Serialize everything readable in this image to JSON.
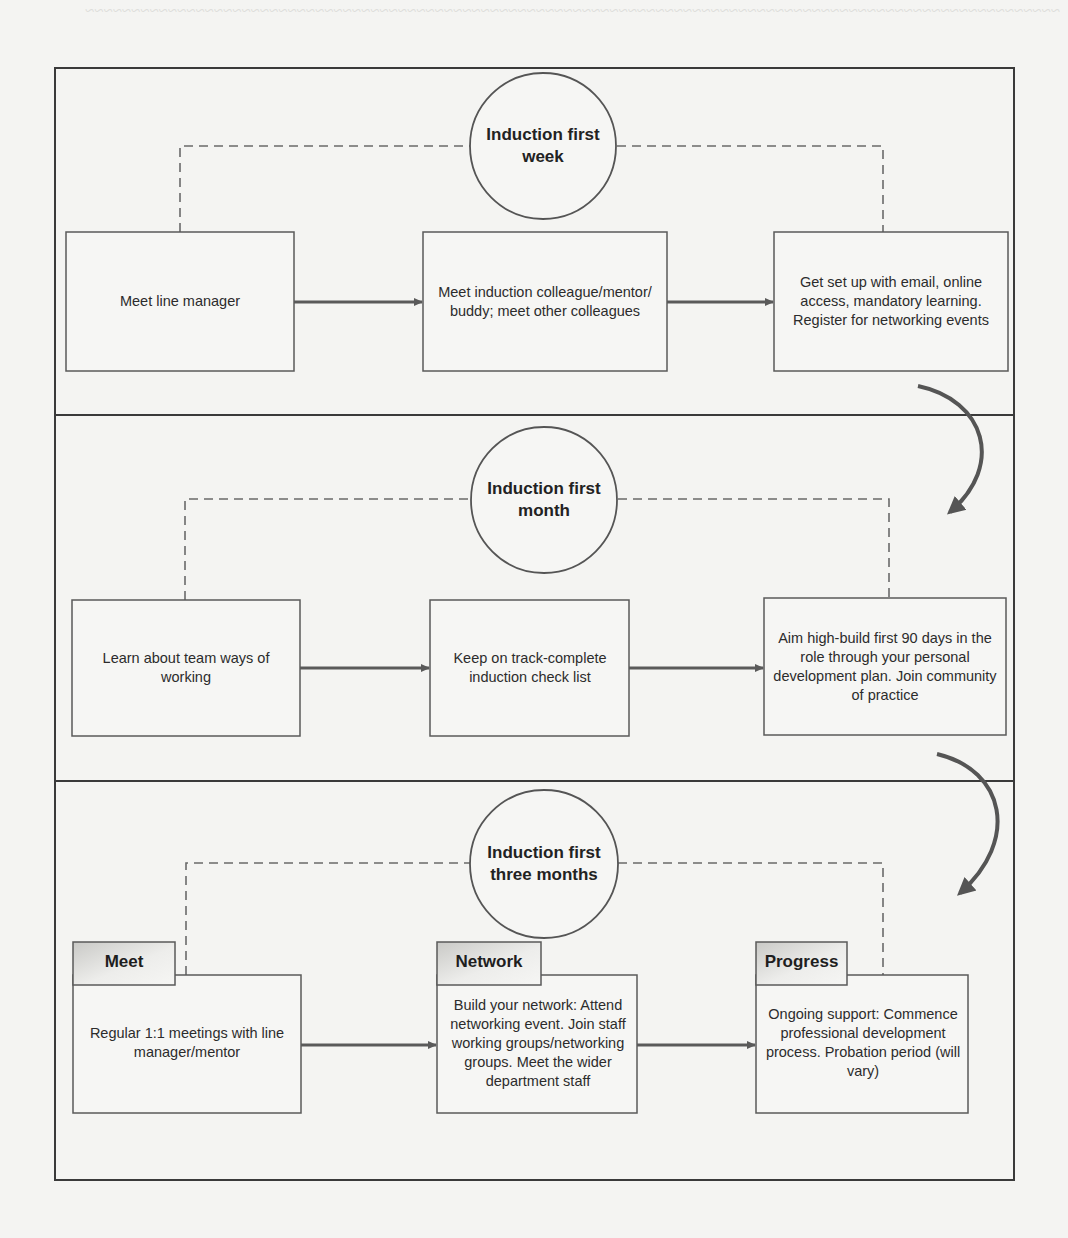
{
  "diagram": {
    "colors": {
      "frame": "#3a3a3a",
      "box_border": "#5a5a5a",
      "arrow": "#5a5a5a",
      "dashed": "#6a6a6a",
      "tab_fill_dark": "#cfcfcc",
      "tab_fill_light": "#f2f2f0",
      "background": "#f4f4f2"
    },
    "sections": [
      {
        "circle_label": "Induction first week",
        "circle_lines": [
          "Induction first",
          "week"
        ],
        "boxes": [
          {
            "text": "Meet line manager"
          },
          {
            "text": "Meet induction colleague/mentor/ buddy; meet other colleagues"
          },
          {
            "text": "Get set up with email, online access, mandatory learning. Register for networking events"
          }
        ]
      },
      {
        "circle_label": "Induction first month",
        "circle_lines": [
          "Induction first",
          "month"
        ],
        "boxes": [
          {
            "text": "Learn about team ways of working"
          },
          {
            "text": "Keep on track-complete induction check list"
          },
          {
            "text": "Aim high-build first 90 days in the role through your personal development plan. Join community of practice"
          }
        ]
      },
      {
        "circle_label": "Induction first three months",
        "circle_lines": [
          "Induction first",
          "three months"
        ],
        "boxes": [
          {
            "tab": "Meet",
            "text": "Regular 1:1 meetings with line manager/mentor"
          },
          {
            "tab": "Network",
            "text": "Build your network: Attend networking event. Join staff working groups/networking groups. Meet the wider department staff"
          },
          {
            "tab": "Progress",
            "text": "Ongoing support: Commence professional development process. Probation period (will vary)"
          }
        ]
      }
    ],
    "connectors": {
      "within_section": "solid arrows box1 → box2 → box3",
      "circle_links": "dashed lines from circle to box1 and box3",
      "between_sections": "curved arrows section1 → section2 → section3"
    }
  }
}
